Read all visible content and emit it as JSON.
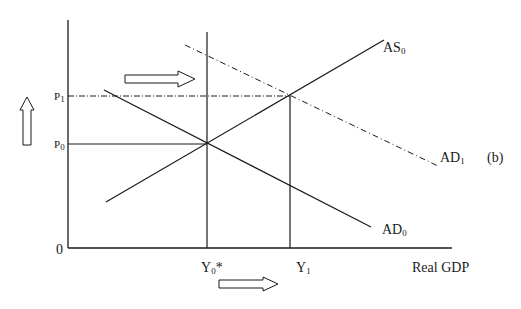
{
  "diagram": {
    "type": "AD-AS model",
    "panel_label": "(b)",
    "axes": {
      "origin_label": "0",
      "x_label": "Real GDP"
    },
    "price_levels": [
      {
        "id": "P0",
        "base": "P",
        "sub": "0"
      },
      {
        "id": "P1",
        "base": "P",
        "sub": "1"
      }
    ],
    "output_levels": [
      {
        "id": "Y0*",
        "base": "Y",
        "sub": "0",
        "suffix": "*"
      },
      {
        "id": "Y1",
        "base": "Y",
        "sub": "1",
        "suffix": ""
      }
    ],
    "curves": [
      {
        "id": "AS0",
        "base": "AS",
        "sub": "0",
        "style": "solid"
      },
      {
        "id": "AD0",
        "base": "AD",
        "sub": "0",
        "style": "solid"
      },
      {
        "id": "AD1",
        "base": "AD",
        "sub": "1",
        "style": "dash-dot"
      }
    ],
    "arrows": [
      {
        "id": "ad-shift-arrow",
        "direction": "right"
      },
      {
        "id": "price-rise-arrow",
        "direction": "up"
      },
      {
        "id": "output-rise-arrow",
        "direction": "right"
      }
    ],
    "colors": {
      "line": "#1a1a1a",
      "background": "#ffffff"
    }
  }
}
